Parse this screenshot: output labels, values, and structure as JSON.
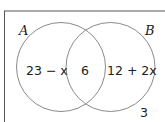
{
  "diagram": {
    "type": "venn",
    "sets": [
      {
        "name": "A"
      },
      {
        "name": "B"
      }
    ],
    "regions": {
      "only_A": "23 − x",
      "A_and_B": "6",
      "only_B": "12 + 2x",
      "outside": "3"
    },
    "colors": {
      "circle_stroke": "#8a8a8a",
      "frame_stroke": "#555555",
      "text": "#222222"
    }
  }
}
